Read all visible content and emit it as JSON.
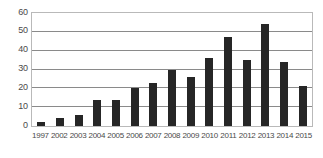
{
  "chart_data": {
    "type": "bar",
    "title": "",
    "subtitle": "",
    "xlabel": "",
    "ylabel": "",
    "categories": [
      "1997",
      "2002",
      "2003",
      "2004",
      "2005",
      "2006",
      "2007",
      "2008",
      "2009",
      "2010",
      "2011",
      "2012",
      "2013",
      "2014",
      "2015"
    ],
    "values": [
      2,
      4,
      6,
      14,
      14,
      20,
      23,
      30,
      26,
      36,
      47,
      35,
      54,
      34,
      21
    ],
    "ylim": [
      0,
      60
    ],
    "yticks": [
      0,
      10,
      20,
      30,
      40,
      50,
      60
    ],
    "ytick_labels": [
      "0",
      "10",
      "20",
      "30",
      "40",
      "50",
      "60"
    ],
    "grid": true,
    "grid_axis": "y",
    "legend": false,
    "legend_position": "none",
    "annotations": [],
    "colors": {
      "bar": "#262626",
      "gridline": "#8a8a8a",
      "axis_border": "#b9b9b9",
      "tick_text": "#4a4a4a",
      "background": "#ffffff"
    }
  }
}
